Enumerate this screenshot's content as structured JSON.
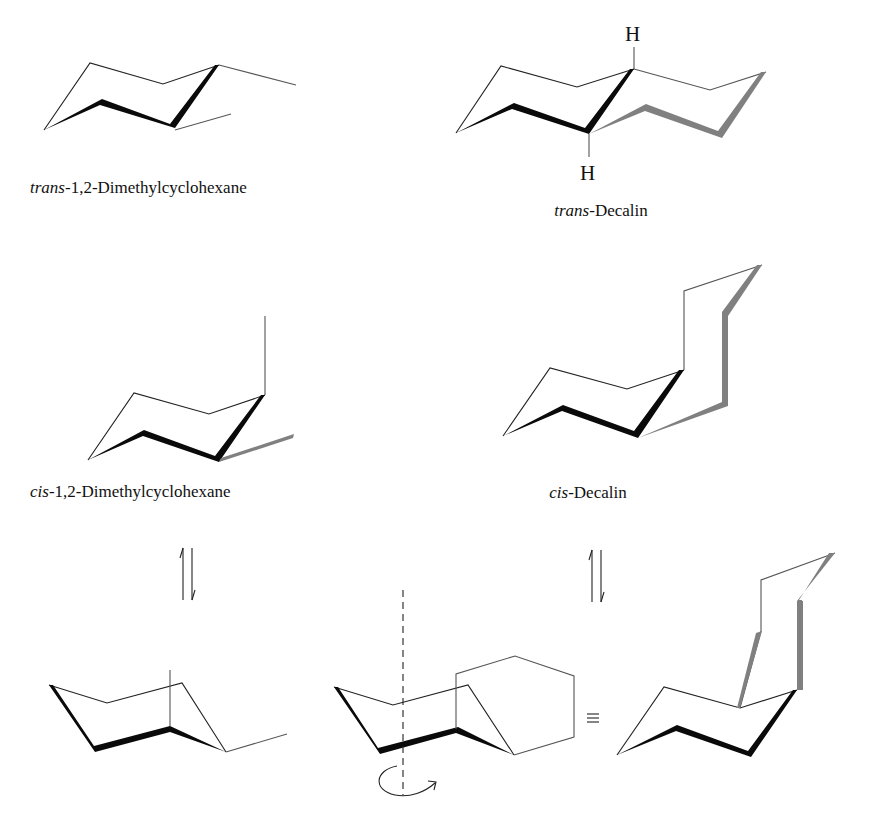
{
  "figure": {
    "panels": [
      {
        "id": "trans-dimethylcyclohexane",
        "label_italic": "trans",
        "label_rest": "-1,2-Dimethylcyclohexane"
      },
      {
        "id": "trans-decalin",
        "label_italic": "trans",
        "label_rest": "-Decalin",
        "atoms": [
          "H",
          "H"
        ]
      },
      {
        "id": "cis-dimethylcyclohexane",
        "label_italic": "cis",
        "label_rest": "-1,2-Dimethylcyclohexane"
      },
      {
        "id": "cis-decalin",
        "label_italic": "cis",
        "label_rest": "-Decalin"
      },
      {
        "id": "cis-dimethylcyclohexane-flipped",
        "label_italic": "",
        "label_rest": ""
      },
      {
        "id": "cis-decalin-flipped-rotation",
        "label_italic": "",
        "label_rest": ""
      },
      {
        "id": "cis-decalin-flipped",
        "label_italic": "",
        "label_rest": ""
      }
    ],
    "symbols": {
      "equilibrium": "⇅",
      "equivalent": "≡",
      "rotation": "rotation-arrow"
    }
  }
}
